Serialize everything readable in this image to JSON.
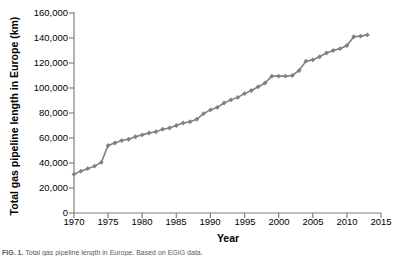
{
  "figure": {
    "caption_label": "FIG. 1.",
    "caption_text": "Total gas pipeline length in Europe. Based on EGIG data."
  },
  "axes": {
    "y_title": "Total gas pipeline length in Europe (km)",
    "x_title": "Year",
    "y_ticks": [
      "0",
      "20,000",
      "40,000",
      "60,000",
      "80,000",
      "100,000",
      "120,000",
      "140,000",
      "160,000"
    ],
    "x_ticks": [
      "1970",
      "1975",
      "1980",
      "1985",
      "1990",
      "1995",
      "2000",
      "2005",
      "2010",
      "2015"
    ]
  },
  "style": {
    "series_color": "#808080",
    "axis_color": "#808080",
    "text_color": "#000000",
    "background": "#ffffff"
  },
  "chart_data": {
    "type": "line",
    "title": "",
    "subtitle": "",
    "xlabel": "Year",
    "ylabel": "Total gas pipeline length in Europe (km)",
    "xlim": [
      1970,
      2015
    ],
    "ylim": [
      0,
      160000
    ],
    "xticks": [
      1970,
      1975,
      1980,
      1985,
      1990,
      1995,
      2000,
      2005,
      2010,
      2015
    ],
    "yticks": [
      0,
      20000,
      40000,
      60000,
      80000,
      100000,
      120000,
      140000,
      160000
    ],
    "grid": false,
    "legend": null,
    "marker": "diamond",
    "series": [
      {
        "name": "Total gas pipeline length in Europe (km)",
        "color": "#808080",
        "x": [
          1970,
          1971,
          1972,
          1973,
          1974,
          1975,
          1976,
          1977,
          1978,
          1979,
          1980,
          1981,
          1982,
          1983,
          1984,
          1985,
          1986,
          1987,
          1988,
          1989,
          1990,
          1991,
          1992,
          1993,
          1994,
          1995,
          1996,
          1997,
          1998,
          1999,
          2000,
          2001,
          2002,
          2003,
          2004,
          2005,
          2006,
          2007,
          2008,
          2009,
          2010,
          2011,
          2012,
          2013
        ],
        "values": [
          31000,
          33500,
          35500,
          37500,
          40500,
          54000,
          56000,
          58000,
          59000,
          61000,
          62500,
          64000,
          65000,
          67000,
          68000,
          70000,
          72000,
          73000,
          75000,
          79500,
          82500,
          84500,
          88000,
          90500,
          92500,
          95500,
          98000,
          101000,
          104000,
          109500,
          109500,
          109500,
          110000,
          114000,
          121500,
          122500,
          125000,
          128000,
          130000,
          131500,
          134000,
          141000,
          141500,
          142500
        ]
      }
    ]
  }
}
